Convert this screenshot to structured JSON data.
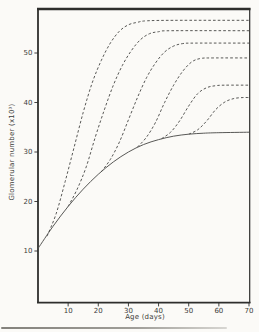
{
  "figure": {
    "title": "",
    "y_axis_label": "Glomerular number (x10³)",
    "x_axis_label": "Age (days)"
  },
  "chart_data": {
    "type": "line",
    "title": "",
    "xlabel": "Age (days)",
    "ylabel": "Glomerular number (x10³)",
    "xlim": [
      0,
      70
    ],
    "ylim": [
      0,
      59
    ],
    "x_ticks": [
      10,
      20,
      30,
      40,
      50,
      60,
      70
    ],
    "y_ticks": [
      10,
      20,
      30,
      40,
      50
    ],
    "grid": false,
    "legend": "none",
    "ink_color": "#2e2e2c",
    "curve_color": "#4f4f4d",
    "paper_color": "#fbfaf7",
    "series": [
      {
        "name": "control-solid",
        "style": "solid",
        "points": [
          [
            0,
            10.5
          ],
          [
            5,
            15
          ],
          [
            10,
            19
          ],
          [
            15,
            22.5
          ],
          [
            20,
            25.5
          ],
          [
            25,
            28
          ],
          [
            30,
            30
          ],
          [
            35,
            31.5
          ],
          [
            40,
            32.5
          ],
          [
            45,
            33.2
          ],
          [
            50,
            33.6
          ],
          [
            55,
            33.8
          ],
          [
            60,
            33.9
          ],
          [
            70,
            34
          ]
        ]
      },
      {
        "name": "dashed-1",
        "style": "dashed",
        "branch_age": 3,
        "plateau": 56.5,
        "points": [
          [
            3,
            13
          ],
          [
            6,
            17.5
          ],
          [
            9,
            24
          ],
          [
            12,
            31
          ],
          [
            15,
            38
          ],
          [
            18,
            44
          ],
          [
            21,
            48.5
          ],
          [
            24,
            52
          ],
          [
            27,
            54.4
          ],
          [
            30,
            55.7
          ],
          [
            33,
            56.2
          ],
          [
            36,
            56.5
          ],
          [
            45,
            56.6
          ],
          [
            70,
            56.6
          ]
        ]
      },
      {
        "name": "dashed-2",
        "style": "dashed",
        "branch_age": 10,
        "plateau": 54.5,
        "points": [
          [
            10,
            19
          ],
          [
            13,
            22.5
          ],
          [
            16,
            27
          ],
          [
            19,
            33
          ],
          [
            22,
            38.5
          ],
          [
            25,
            43.5
          ],
          [
            28,
            47.5
          ],
          [
            31,
            50.5
          ],
          [
            34,
            52.7
          ],
          [
            37,
            53.9
          ],
          [
            40,
            54.3
          ],
          [
            44,
            54.5
          ],
          [
            70,
            54.5
          ]
        ]
      },
      {
        "name": "dashed-3",
        "style": "dashed",
        "branch_age": 21,
        "plateau": 52,
        "points": [
          [
            21,
            26
          ],
          [
            24,
            28.5
          ],
          [
            27,
            32
          ],
          [
            30,
            36.5
          ],
          [
            33,
            41
          ],
          [
            36,
            45
          ],
          [
            39,
            48
          ],
          [
            42,
            50.2
          ],
          [
            45,
            51.4
          ],
          [
            48,
            51.9
          ],
          [
            52,
            52
          ],
          [
            70,
            52
          ]
        ]
      },
      {
        "name": "dashed-4",
        "style": "dashed",
        "branch_age": 33,
        "plateau": 49,
        "points": [
          [
            33,
            31
          ],
          [
            36,
            33
          ],
          [
            39,
            36
          ],
          [
            42,
            40
          ],
          [
            45,
            43.5
          ],
          [
            48,
            46.3
          ],
          [
            51,
            48.2
          ],
          [
            54,
            48.9
          ],
          [
            58,
            49
          ],
          [
            70,
            49
          ]
        ]
      },
      {
        "name": "dashed-5",
        "style": "dashed",
        "branch_age": 41,
        "plateau": 43.5,
        "points": [
          [
            41,
            32.7
          ],
          [
            44,
            34
          ],
          [
            47,
            36.3
          ],
          [
            50,
            39.3
          ],
          [
            53,
            41.8
          ],
          [
            56,
            43
          ],
          [
            59,
            43.4
          ],
          [
            62,
            43.5
          ],
          [
            70,
            43.5
          ]
        ]
      },
      {
        "name": "dashed-6",
        "style": "dashed",
        "branch_age": 50,
        "plateau": 41,
        "points": [
          [
            50,
            33.6
          ],
          [
            53,
            34.5
          ],
          [
            56,
            36.3
          ],
          [
            59,
            38.6
          ],
          [
            62,
            40.1
          ],
          [
            65,
            40.8
          ],
          [
            68,
            41
          ],
          [
            70,
            41
          ]
        ]
      }
    ]
  }
}
